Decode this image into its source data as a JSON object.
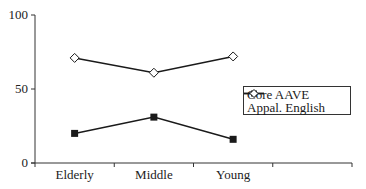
{
  "chart_data": {
    "type": "line",
    "title": "",
    "xlabel": "",
    "ylabel": "",
    "categories": [
      "Elderly",
      "Middle",
      "Young"
    ],
    "x_slots": 4,
    "ylim": [
      0,
      100
    ],
    "yticks": [
      0,
      50,
      100
    ],
    "grid": false,
    "legend_position": "right, middle (inside plot area)",
    "series": [
      {
        "name": "Core AAVE",
        "marker": "filled-square",
        "values": [
          20,
          31,
          16
        ]
      },
      {
        "name": "Appal. English",
        "marker": "open-diamond",
        "values": [
          71,
          61,
          72
        ]
      }
    ]
  },
  "axis": {
    "y_tick_labels": [
      "0",
      "50",
      "100"
    ],
    "x_tick_labels": [
      "Elderly",
      "Middle",
      "Young"
    ]
  },
  "legend": {
    "items": [
      {
        "label": "Core AAVE"
      },
      {
        "label": "Appal. English"
      }
    ]
  },
  "colors": {
    "line": "#1a1a1a",
    "axis": "#333333",
    "background": "#ffffff"
  }
}
